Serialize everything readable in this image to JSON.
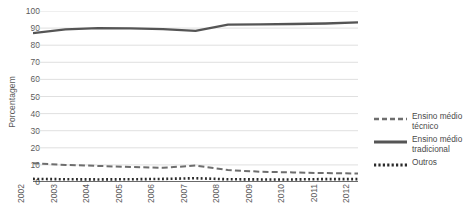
{
  "chart_data": {
    "type": "line",
    "title": "",
    "xlabel": "",
    "ylabel": "Porcentagem",
    "categories": [
      "2002",
      "2003",
      "2004",
      "2005",
      "2006",
      "2007",
      "2008",
      "2009",
      "2010",
      "2011",
      "2012"
    ],
    "x": [
      2002,
      2003,
      2004,
      2005,
      2006,
      2007,
      2008,
      2009,
      2010,
      2011,
      2012
    ],
    "ylim": [
      0,
      100
    ],
    "yticks": [
      0,
      10,
      20,
      30,
      40,
      50,
      60,
      70,
      80,
      90,
      100
    ],
    "grid": true,
    "legend_position": "right",
    "series": [
      {
        "name": "Ensino médio\ntécnico",
        "style": "dashed",
        "color": "#6e6e6e",
        "values": [
          11.0,
          10.0,
          9.4,
          8.8,
          8.3,
          9.6,
          7.0,
          6.0,
          5.6,
          5.2,
          5.0
        ]
      },
      {
        "name": "Ensino médio\ntradicional",
        "style": "solid",
        "color": "#555555",
        "values": [
          87.0,
          89.2,
          90.0,
          89.8,
          89.4,
          88.4,
          92.0,
          92.2,
          92.4,
          92.7,
          93.3
        ]
      },
      {
        "name": "Outros",
        "style": "dotted",
        "color": "#2b2b2b",
        "values": [
          1.8,
          1.6,
          1.5,
          1.6,
          1.8,
          2.2,
          1.6,
          1.5,
          1.5,
          1.7,
          1.7
        ]
      }
    ]
  },
  "axes": {
    "y_title": "Porcentagem",
    "y_tick_labels": [
      "100",
      "90",
      "80",
      "70",
      "60",
      "50",
      "40",
      "30",
      "20",
      "10",
      "0"
    ],
    "x_tick_labels": [
      "2002",
      "2003",
      "2004",
      "2005",
      "2006",
      "2007",
      "2008",
      "2009",
      "2010",
      "2011",
      "2012"
    ]
  },
  "legend": {
    "items": [
      {
        "label": "Ensino médio\ntécnico",
        "style": "dashed"
      },
      {
        "label": "Ensino médio\ntradicional",
        "style": "solid"
      },
      {
        "label": "Outros",
        "style": "dotted"
      }
    ]
  },
  "colors": {
    "background": "#ffffff",
    "grid": "#d8d8d8",
    "axis_text": "#5a5a5a",
    "series_tecnico": "#6e6e6e",
    "series_tradicional": "#555555",
    "series_outros": "#2b2b2b"
  }
}
